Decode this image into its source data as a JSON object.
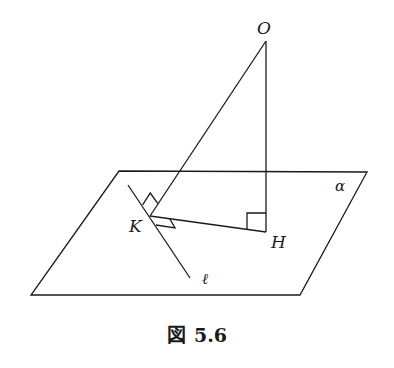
{
  "figure": {
    "caption_prefix": "図",
    "caption_number": "5.6",
    "labels": {
      "O": "O",
      "K": "K",
      "H": "H",
      "alpha": "α",
      "ell": "ℓ"
    },
    "points": {
      "O": [
        266,
        41
      ],
      "K": [
        150,
        216
      ],
      "H": [
        266,
        232
      ],
      "ell_start": [
        128,
        185
      ],
      "ell_end": [
        190,
        278
      ]
    },
    "plane_alpha": {
      "corners": [
        [
          119,
          171
        ],
        [
          367,
          172
        ],
        [
          300,
          295
        ],
        [
          31,
          295
        ]
      ]
    },
    "right_angle_marks": [
      {
        "at": "H",
        "between": [
          "HK",
          "HO"
        ]
      },
      {
        "at": "K",
        "between": [
          "KO",
          "ell"
        ]
      },
      {
        "at": "K",
        "between": [
          "KH",
          "ell"
        ]
      }
    ],
    "stroke_color": "#1a1a1a",
    "background": "#ffffff"
  }
}
